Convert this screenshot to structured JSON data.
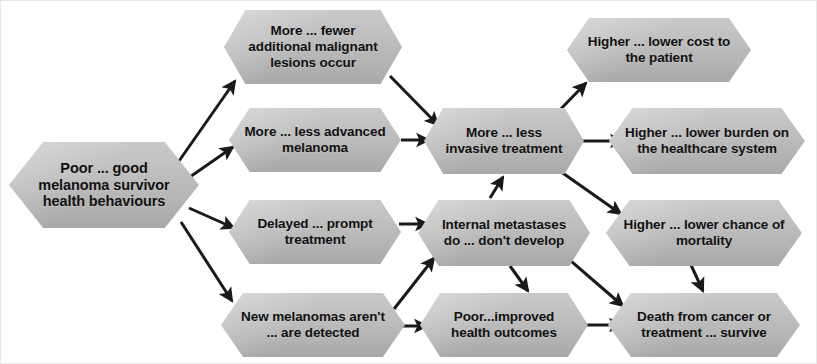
{
  "diagram": {
    "background_color": "#ffffff",
    "node_fill_color": "#bdbdbd",
    "arrow_color": "#1a1a1a",
    "text_color": "#111111",
    "nodes": [
      {
        "id": "root",
        "label": "Poor ... good melanoma survivor health behaviours",
        "column": 1,
        "x": 8,
        "y": 141,
        "w": 190,
        "h": 86,
        "font_size": 14.5
      },
      {
        "id": "lesions",
        "label": "More ... fewer additional malignant lesions occur",
        "column": 2,
        "x": 223,
        "y": 9,
        "w": 178,
        "h": 74,
        "font_size": 13.5
      },
      {
        "id": "advanced",
        "label": "More ... less advanced melanoma",
        "column": 2,
        "x": 228,
        "y": 107,
        "w": 172,
        "h": 64,
        "font_size": 13.5
      },
      {
        "id": "delayed",
        "label": "Delayed ... prompt treatment",
        "column": 2,
        "x": 228,
        "y": 199,
        "w": 172,
        "h": 64,
        "font_size": 13.5
      },
      {
        "id": "newmel",
        "label": "New melanomas aren't ... are detected",
        "column": 2,
        "x": 220,
        "y": 292,
        "w": 184,
        "h": 64,
        "font_size": 13.5
      },
      {
        "id": "invasive",
        "label": "More ... less invasive treatment",
        "column": 3,
        "x": 423,
        "y": 107,
        "w": 160,
        "h": 66,
        "font_size": 13.5
      },
      {
        "id": "metastases",
        "label": "Internal metastases do ... don't develop",
        "column": 3,
        "x": 417,
        "y": 199,
        "w": 172,
        "h": 66,
        "font_size": 13.5
      },
      {
        "id": "outcomes",
        "label": "Poor...improved health outcomes",
        "column": 3,
        "x": 419,
        "y": 292,
        "w": 168,
        "h": 64,
        "font_size": 13.5
      },
      {
        "id": "cost",
        "label": "Higher ... lower cost  to the patient",
        "column": 4,
        "x": 566,
        "y": 17,
        "w": 184,
        "h": 64,
        "font_size": 13.5
      },
      {
        "id": "burden",
        "label": "Higher ... lower burden on the healthcare system",
        "column": 4,
        "x": 608,
        "y": 107,
        "w": 196,
        "h": 66,
        "font_size": 13.5
      },
      {
        "id": "mortality",
        "label": "Higher ... lower chance of mortality",
        "column": 4,
        "x": 605,
        "y": 199,
        "w": 196,
        "h": 66,
        "font_size": 13.5
      },
      {
        "id": "death",
        "label": "Death from cancer or treatment ... survive",
        "column": 4,
        "x": 607,
        "y": 292,
        "w": 192,
        "h": 64,
        "font_size": 13.5
      }
    ],
    "edges": [
      {
        "id": "root-lesions",
        "from": "root",
        "to": "lesions",
        "x1": 178,
        "y1": 160,
        "x2": 234,
        "y2": 80
      },
      {
        "id": "root-advanced",
        "from": "root",
        "to": "advanced",
        "x1": 186,
        "y1": 178,
        "x2": 232,
        "y2": 146
      },
      {
        "id": "root-delayed",
        "from": "root",
        "to": "delayed",
        "x1": 188,
        "y1": 207,
        "x2": 233,
        "y2": 227
      },
      {
        "id": "root-newmel",
        "from": "root",
        "to": "newmel",
        "x1": 180,
        "y1": 221,
        "x2": 231,
        "y2": 300
      },
      {
        "id": "lesions-invasive",
        "from": "lesions",
        "to": "invasive",
        "x1": 389,
        "y1": 75,
        "x2": 437,
        "y2": 124
      },
      {
        "id": "advanced-invasive",
        "from": "advanced",
        "to": "invasive",
        "x1": 400,
        "y1": 139,
        "x2": 428,
        "y2": 139
      },
      {
        "id": "delayed-metastases",
        "from": "delayed",
        "to": "metastases",
        "x1": 398,
        "y1": 223,
        "x2": 427,
        "y2": 223
      },
      {
        "id": "metastases-invasive",
        "from": "metastases",
        "to": "invasive",
        "x1": 489,
        "y1": 197,
        "x2": 502,
        "y2": 176
      },
      {
        "id": "newmel-metastases",
        "from": "newmel",
        "to": "metastases",
        "x1": 393,
        "y1": 308,
        "x2": 433,
        "y2": 257
      },
      {
        "id": "newmel-outcomes",
        "from": "newmel",
        "to": "outcomes",
        "x1": 400,
        "y1": 325,
        "x2": 426,
        "y2": 325
      },
      {
        "id": "metastases-outcomes",
        "from": "metastases",
        "to": "outcomes",
        "x1": 509,
        "y1": 265,
        "x2": 527,
        "y2": 290
      },
      {
        "id": "invasive-cost",
        "from": "invasive",
        "to": "cost",
        "x1": 552,
        "y1": 116,
        "x2": 585,
        "y2": 82
      },
      {
        "id": "invasive-burden",
        "from": "invasive",
        "to": "burden",
        "x1": 581,
        "y1": 140,
        "x2": 622,
        "y2": 140
      },
      {
        "id": "invasive-mortality",
        "from": "invasive",
        "to": "mortality",
        "x1": 556,
        "y1": 168,
        "x2": 620,
        "y2": 213
      },
      {
        "id": "metastases-death",
        "from": "metastases",
        "to": "death",
        "x1": 556,
        "y1": 248,
        "x2": 622,
        "y2": 305
      },
      {
        "id": "outcomes-death",
        "from": "outcomes",
        "to": "death",
        "x1": 585,
        "y1": 324,
        "x2": 621,
        "y2": 324
      },
      {
        "id": "mortality-death",
        "from": "mortality",
        "to": "death",
        "x1": 690,
        "y1": 264,
        "x2": 702,
        "y2": 290
      }
    ]
  }
}
